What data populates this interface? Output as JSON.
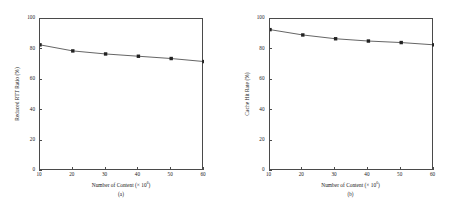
{
  "figure": {
    "panels": [
      {
        "caption": "(a)",
        "xlabel_prefix": "Number of Content (× 10",
        "xlabel_exp": "6",
        "xlabel_suffix": ")",
        "ylabel": "Reduced RTT Ratio (%)"
      },
      {
        "caption": "(b)",
        "xlabel_prefix": "Number of Content (× 10",
        "xlabel_exp": "6",
        "xlabel_suffix": ")",
        "ylabel": "Cache Hit Rate (%)"
      }
    ],
    "yticks": [
      "0",
      "20",
      "40",
      "60",
      "80",
      "100"
    ],
    "xticks": [
      "10",
      "20",
      "30",
      "40",
      "50",
      "60"
    ]
  },
  "chart_data": [
    {
      "type": "line",
      "title": "(a)",
      "xlabel": "Number of Content (× 10^6)",
      "ylabel": "Reduced RTT Ratio (%)",
      "xlim": [
        10,
        60
      ],
      "ylim": [
        0,
        100
      ],
      "xticks": [
        10,
        20,
        30,
        40,
        50,
        60
      ],
      "yticks": [
        0,
        20,
        40,
        60,
        80,
        100
      ],
      "grid": false,
      "legend": null,
      "marker": "filled-square",
      "color": "#222222",
      "x": [
        10,
        20,
        30,
        40,
        50,
        60
      ],
      "values": [
        83,
        79,
        77,
        75.5,
        74,
        72
      ]
    },
    {
      "type": "line",
      "title": "(b)",
      "xlabel": "Number of Content (× 10^6)",
      "ylabel": "Cache Hit Rate (%)",
      "xlim": [
        10,
        60
      ],
      "ylim": [
        0,
        100
      ],
      "xticks": [
        10,
        20,
        30,
        40,
        50,
        60
      ],
      "yticks": [
        0,
        20,
        40,
        60,
        80,
        100
      ],
      "grid": false,
      "legend": null,
      "marker": "filled-square",
      "color": "#222222",
      "x": [
        10,
        20,
        30,
        40,
        50,
        60
      ],
      "values": [
        93,
        89.5,
        87,
        85.5,
        84.5,
        83
      ]
    }
  ]
}
